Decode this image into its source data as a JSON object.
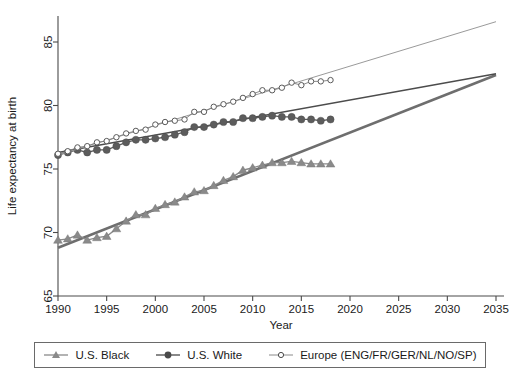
{
  "chart_data": {
    "type": "line",
    "title": "",
    "xlabel": "Year",
    "ylabel": "Life expectancy at birth",
    "xlim": [
      1988,
      2036
    ],
    "ylim": [
      64,
      87.5
    ],
    "xticks": [
      1990,
      1995,
      2000,
      2005,
      2010,
      2015,
      2020,
      2025,
      2030,
      2035
    ],
    "yticks": [
      65,
      70,
      75,
      80,
      85
    ],
    "grid": false,
    "legend_position": "below-plot",
    "series": [
      {
        "name": "U.S. Black",
        "marker": "triangle",
        "color": "#8a8a8a",
        "x": [
          1990,
          1991,
          1992,
          1993,
          1994,
          1995,
          1996,
          1997,
          1998,
          1999,
          2000,
          2001,
          2002,
          2003,
          2004,
          2005,
          2006,
          2007,
          2008,
          2009,
          2010,
          2011,
          2012,
          2013,
          2014,
          2015,
          2016,
          2017,
          2018
        ],
        "values": [
          69.4,
          69.5,
          69.8,
          69.4,
          69.6,
          69.7,
          70.3,
          70.9,
          71.4,
          71.4,
          71.9,
          72.2,
          72.4,
          72.8,
          73.2,
          73.3,
          73.7,
          74.1,
          74.4,
          74.9,
          75.1,
          75.3,
          75.5,
          75.5,
          75.6,
          75.5,
          75.4,
          75.4,
          75.4
        ],
        "trend_line": {
          "x": [
            1990,
            2035
          ],
          "y": [
            68.8,
            82.4
          ]
        }
      },
      {
        "name": "U.S. White",
        "marker": "filled-circle",
        "color": "#5c5c5c",
        "x": [
          1990,
          1991,
          1992,
          1993,
          1994,
          1995,
          1996,
          1997,
          1998,
          1999,
          2000,
          2001,
          2002,
          2003,
          2004,
          2005,
          2006,
          2007,
          2008,
          2009,
          2010,
          2011,
          2012,
          2013,
          2014,
          2015,
          2016,
          2017,
          2018
        ],
        "values": [
          76.1,
          76.3,
          76.5,
          76.3,
          76.5,
          76.5,
          76.8,
          77.1,
          77.3,
          77.3,
          77.4,
          77.5,
          77.7,
          77.9,
          78.3,
          78.3,
          78.5,
          78.7,
          78.7,
          79.0,
          79.0,
          79.1,
          79.2,
          79.1,
          79.1,
          78.9,
          78.9,
          78.8,
          78.9
        ],
        "trend_line": {
          "x": [
            1990,
            2035
          ],
          "y": [
            76.3,
            82.5
          ]
        }
      },
      {
        "name": "Europe (ENG/FR/GER/NL/NO/SP)",
        "marker": "open-circle",
        "color": "#5a5a5a",
        "x": [
          1990,
          1991,
          1992,
          1993,
          1994,
          1995,
          1996,
          1997,
          1998,
          1999,
          2000,
          2001,
          2002,
          2003,
          2004,
          2005,
          2006,
          2007,
          2008,
          2009,
          2010,
          2011,
          2012,
          2013,
          2014,
          2015,
          2016,
          2017,
          2018
        ],
        "values": [
          76.2,
          76.4,
          76.7,
          76.8,
          77.1,
          77.2,
          77.5,
          77.8,
          78.0,
          78.1,
          78.5,
          78.7,
          78.8,
          78.9,
          79.5,
          79.5,
          79.9,
          80.1,
          80.3,
          80.6,
          80.9,
          81.2,
          81.2,
          81.4,
          81.8,
          81.6,
          81.9,
          81.9,
          82.0
        ],
        "trend_line": {
          "x": [
            1990,
            2035
          ],
          "y": [
            76.1,
            86.6
          ]
        }
      }
    ]
  },
  "legend": {
    "items": [
      {
        "label": "U.S. Black",
        "marker": "triangle"
      },
      {
        "label": "U.S. White",
        "marker": "filled-circle"
      },
      {
        "label": "Europe (ENG/FR/GER/NL/NO/SP)",
        "marker": "open-circle"
      }
    ]
  }
}
